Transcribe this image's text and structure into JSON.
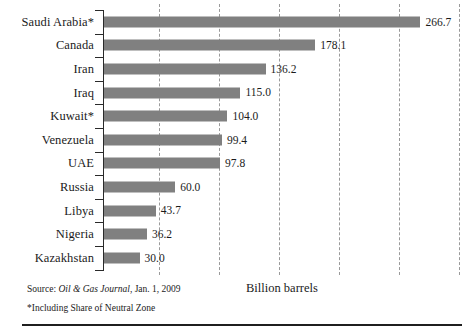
{
  "chart_data": {
    "type": "bar",
    "orientation": "horizontal",
    "title": "",
    "xlabel": "Billion barrels",
    "ylabel": "",
    "xlim": [
      0,
      300
    ],
    "grid": "vertical dashed gridlines every 50 billion barrels",
    "gridline_values": [
      50,
      100,
      150,
      200,
      250,
      300
    ],
    "legend": "none",
    "categories": [
      "Saudi Arabia*",
      "Canada",
      "Iran",
      "Iraq",
      "Kuwait*",
      "Venezuela",
      "UAE",
      "Russia",
      "Libya",
      "Nigeria",
      "Kazakhstan"
    ],
    "values": [
      266.7,
      178.1,
      136.2,
      115.0,
      104.0,
      99.4,
      97.8,
      60.0,
      43.7,
      36.2,
      30.0
    ],
    "value_labels": [
      "266.7",
      "178.1",
      "136.2",
      "115.0",
      "104.0",
      "99.4",
      "97.8",
      "60.0",
      "43.7",
      "36.2",
      "30.0"
    ],
    "bar_color": "#808080",
    "gridline_color": "#9a9a9a",
    "axis_color": "#2a2a2a"
  },
  "footer": {
    "source_prefix": "Source: ",
    "source_italic": "Oil & Gas Journal",
    "source_suffix": ", Jan. 1, 2009",
    "footnote": "*Including Share of Neutral Zone"
  },
  "axis": {
    "title": "Billion barrels"
  }
}
